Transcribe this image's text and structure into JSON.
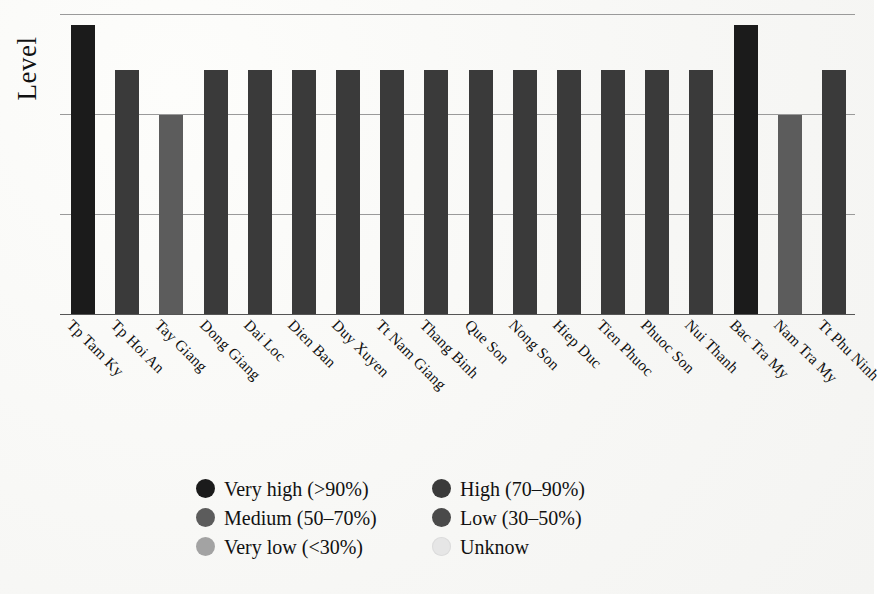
{
  "axis": {
    "y_title": "Level",
    "gridline_count": 4
  },
  "legend": {
    "items": [
      {
        "label": "Very high (>90%)",
        "color": "#1b1b1b",
        "key": "very_high"
      },
      {
        "label": "High (70–90%)",
        "color": "#3a3a3a",
        "key": "high"
      },
      {
        "label": "Medium (50–70%)",
        "color": "#5c5c5c",
        "key": "medium"
      },
      {
        "label": "Low (30–50%)",
        "color": "#4a4a4a",
        "key": "low"
      },
      {
        "label": "Very low (<30%)",
        "color": "#a3a3a3",
        "key": "very_low"
      },
      {
        "label": "Unknow",
        "color": "#e6e6e6",
        "key": "unknown"
      }
    ]
  },
  "chart_data": {
    "type": "bar",
    "title": "",
    "xlabel": "",
    "ylabel": "Level",
    "grid": true,
    "legend_position": "bottom",
    "y_scale": "ordinal",
    "ylim": [
      0,
      4
    ],
    "y_levels": [
      "Medium",
      "High",
      "Very high"
    ],
    "categories": [
      "Tp Tam Ky",
      "Tp Hoi An",
      "Tay Giang",
      "Dong Giang",
      "Dai Loc",
      "Dien Ban",
      "Duy Xuyen",
      "Tt Nam Giang",
      "Thang Binh",
      "Que Son",
      "Nong Son",
      "Hiep Duc",
      "Tien Phuoc",
      "Phuoc Son",
      "Nui Thanh",
      "Bac Tra My",
      "Nam Tra My",
      "Tt Phu Ninh"
    ],
    "values": [
      3.85,
      3.25,
      2.65,
      3.25,
      3.25,
      3.25,
      3.25,
      3.25,
      3.25,
      3.25,
      3.25,
      3.25,
      3.25,
      3.25,
      3.25,
      3.85,
      2.65,
      3.25
    ],
    "levels": [
      "Very high",
      "High",
      "Medium",
      "High",
      "High",
      "High",
      "High",
      "High",
      "High",
      "High",
      "High",
      "High",
      "High",
      "High",
      "High",
      "Very high",
      "Medium",
      "High"
    ],
    "colors": [
      "#1b1b1b",
      "#3a3a3a",
      "#5c5c5c",
      "#3a3a3a",
      "#3a3a3a",
      "#3a3a3a",
      "#3a3a3a",
      "#3a3a3a",
      "#3a3a3a",
      "#3a3a3a",
      "#3a3a3a",
      "#3a3a3a",
      "#3a3a3a",
      "#3a3a3a",
      "#3a3a3a",
      "#1b1b1b",
      "#5c5c5c",
      "#3a3a3a"
    ]
  }
}
